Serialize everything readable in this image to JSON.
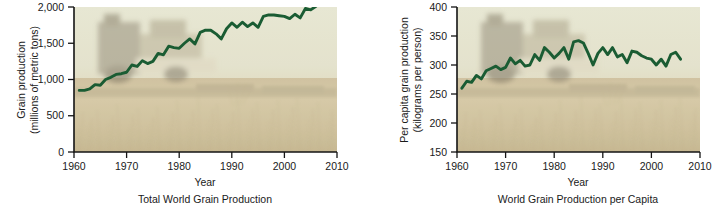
{
  "figure": {
    "panels": [
      "left",
      "right"
    ]
  },
  "chart_data": [
    {
      "id": "total-world-grain-production",
      "type": "line",
      "title": "Total World Grain Production",
      "caption": "Total World Grain Production",
      "xlabel": "Year",
      "ylabel": "Grain production\n(millions of metric tons)",
      "ylabel_line1": "Grain production",
      "ylabel_line2": "(millions of metric tons)",
      "xlim": [
        1960,
        2010
      ],
      "ylim": [
        0,
        2000
      ],
      "xticks": [
        1960,
        1970,
        1980,
        1990,
        2000,
        2010
      ],
      "xticklabels": [
        "1960",
        "1970",
        "1980",
        "1990",
        "2000",
        "2010"
      ],
      "yticks": [
        0,
        500,
        1000,
        1500,
        2000
      ],
      "yticklabels": [
        "0",
        "500",
        "1,000",
        "1,500",
        "2,000"
      ],
      "grid": false,
      "legend": "none",
      "line_color": "#1a5c33",
      "background": "photo-wheat-field-with-combine-harvester",
      "series": [
        {
          "name": "World grain production",
          "x": [
            1961,
            1962,
            1963,
            1964,
            1965,
            1966,
            1967,
            1968,
            1969,
            1970,
            1971,
            1972,
            1973,
            1974,
            1975,
            1976,
            1977,
            1978,
            1979,
            1980,
            1981,
            1982,
            1983,
            1984,
            1985,
            1986,
            1987,
            1988,
            1989,
            1990,
            1991,
            1992,
            1993,
            1994,
            1995,
            1996,
            1997,
            1998,
            1999,
            2000,
            2001,
            2002,
            2003,
            2004,
            2005,
            2006
          ],
          "values": [
            850,
            850,
            870,
            930,
            920,
            1000,
            1030,
            1070,
            1080,
            1100,
            1200,
            1180,
            1260,
            1220,
            1250,
            1360,
            1340,
            1460,
            1440,
            1430,
            1500,
            1560,
            1490,
            1650,
            1680,
            1680,
            1630,
            1560,
            1700,
            1780,
            1720,
            1790,
            1730,
            1780,
            1720,
            1870,
            1890,
            1890,
            1880,
            1870,
            1840,
            1900,
            1850,
            1980,
            1960,
            2010
          ]
        }
      ]
    },
    {
      "id": "world-grain-production-per-capita",
      "type": "line",
      "title": "World Grain Production per Capita",
      "caption": "World Grain Production per Capita",
      "xlabel": "Year",
      "ylabel": "Per capita grain production\n(kilograms per person)",
      "ylabel_line1": "Per capita grain production",
      "ylabel_line2": "(kilograms per person)",
      "xlim": [
        1960,
        2010
      ],
      "ylim": [
        150,
        400
      ],
      "xticks": [
        1960,
        1970,
        1980,
        1990,
        2000,
        2010
      ],
      "xticklabels": [
        "1960",
        "1970",
        "1980",
        "1990",
        "2000",
        "2010"
      ],
      "yticks": [
        150,
        200,
        250,
        300,
        350,
        400
      ],
      "yticklabels": [
        "150",
        "200",
        "250",
        "300",
        "350",
        "400"
      ],
      "grid": false,
      "legend": "none",
      "line_color": "#1a5c33",
      "background": "photo-wheat-field-with-combine-harvester",
      "series": [
        {
          "name": "Per capita grain production",
          "x": [
            1961,
            1962,
            1963,
            1964,
            1965,
            1966,
            1967,
            1968,
            1969,
            1970,
            1971,
            1972,
            1973,
            1974,
            1975,
            1976,
            1977,
            1978,
            1979,
            1980,
            1981,
            1982,
            1983,
            1984,
            1985,
            1986,
            1987,
            1988,
            1989,
            1990,
            1991,
            1992,
            1993,
            1994,
            1995,
            1996,
            1997,
            1998,
            1999,
            2000,
            2001,
            2002,
            2003,
            2004,
            2005,
            2006
          ],
          "values": [
            260,
            272,
            270,
            282,
            276,
            290,
            294,
            298,
            292,
            296,
            312,
            302,
            308,
            298,
            300,
            318,
            308,
            330,
            322,
            312,
            320,
            330,
            310,
            340,
            342,
            338,
            320,
            300,
            320,
            330,
            318,
            330,
            314,
            318,
            304,
            324,
            322,
            316,
            312,
            310,
            300,
            310,
            298,
            318,
            322,
            310
          ]
        }
      ]
    }
  ]
}
